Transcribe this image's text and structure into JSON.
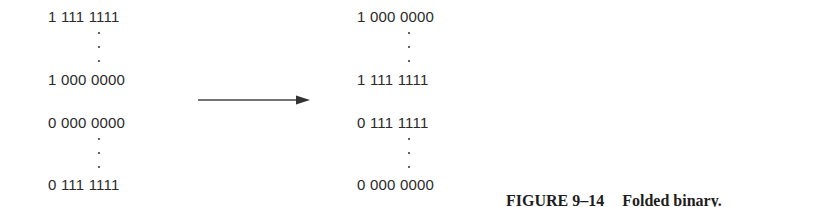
{
  "left_column": {
    "rows": [
      "1 111 1111",
      "1 000 0000",
      "0 000 0000",
      "0 111 1111"
    ]
  },
  "right_column": {
    "rows": [
      "1 000 0000",
      "1 111 1111",
      "0 111 1111",
      "0 000 0000"
    ]
  },
  "caption": {
    "label": "FIGURE 9–14",
    "title": "Folded binary."
  }
}
